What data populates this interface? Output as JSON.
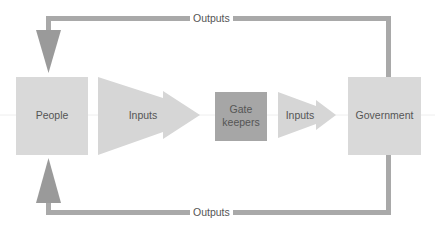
{
  "diagram": {
    "nodes": {
      "people": {
        "label": "People"
      },
      "gatekeepers": {
        "line1": "Gate",
        "line2": "keepers"
      },
      "government": {
        "label": "Government"
      }
    },
    "arrows": {
      "inputs_1": {
        "label": "Inputs"
      },
      "inputs_2": {
        "label": "Inputs"
      },
      "outputs_top": {
        "label": "Outputs"
      },
      "outputs_bottom": {
        "label": "Outputs"
      }
    },
    "colors": {
      "box_light": "#d9d9d9",
      "box_dark": "#a6a6a6",
      "arrow_fill": "#d6d6d6",
      "feedback_line": "#a9a9a9",
      "feedback_head": "#9a9a9a",
      "text": "#555555"
    }
  }
}
